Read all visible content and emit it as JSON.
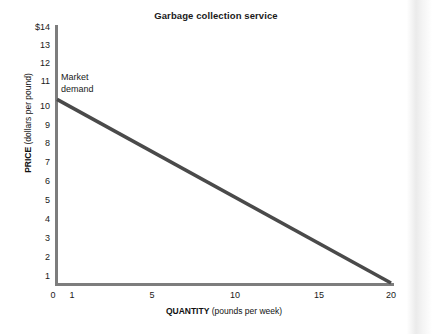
{
  "chart_data": {
    "type": "line",
    "title": "Garbage collection service",
    "xlabel_bold": "QUANTITY",
    "xlabel_rest": " (pounds per week)",
    "ylabel_bold": "PRICE",
    "ylabel_rest": " (dollars per pound)",
    "xlim": [
      0,
      20.5
    ],
    "ylim": [
      0,
      14
    ],
    "grid": false,
    "legend": "none",
    "x_ticks": [
      0,
      1,
      5,
      10,
      15,
      20
    ],
    "x_tick_labels": [
      "0",
      "1",
      "5",
      "10",
      "15",
      "20"
    ],
    "y_ticks": [
      1,
      2,
      3,
      4,
      5,
      6,
      7,
      8,
      9,
      10,
      11,
      12,
      13,
      14
    ],
    "y_tick_labels": [
      "1",
      "2",
      "3",
      "4",
      "5",
      "6",
      "7",
      "8",
      "9",
      "10",
      "11",
      "12",
      "13",
      "$14"
    ],
    "series": [
      {
        "name": "Market demand",
        "color": "#4a4a4a",
        "linewidth": 3.5,
        "x": [
          0,
          20
        ],
        "y": [
          10,
          0
        ],
        "points": [
          {
            "quantity": 0,
            "price": 10
          },
          {
            "quantity": 1,
            "price": 9.5
          },
          {
            "quantity": 5,
            "price": 7.5
          },
          {
            "quantity": 10,
            "price": 5
          },
          {
            "quantity": 15,
            "price": 2.5
          },
          {
            "quantity": 20,
            "price": 0
          }
        ]
      }
    ],
    "annotations": [
      {
        "name": "market-demand-label",
        "text": "Market\ndemand",
        "x": 0.3,
        "y": 11.6
      }
    ],
    "colors": {
      "axis": "#7d7d7d",
      "line": "#4a4a4a",
      "text": "#1a1a1a",
      "background": "#ffffff"
    }
  }
}
